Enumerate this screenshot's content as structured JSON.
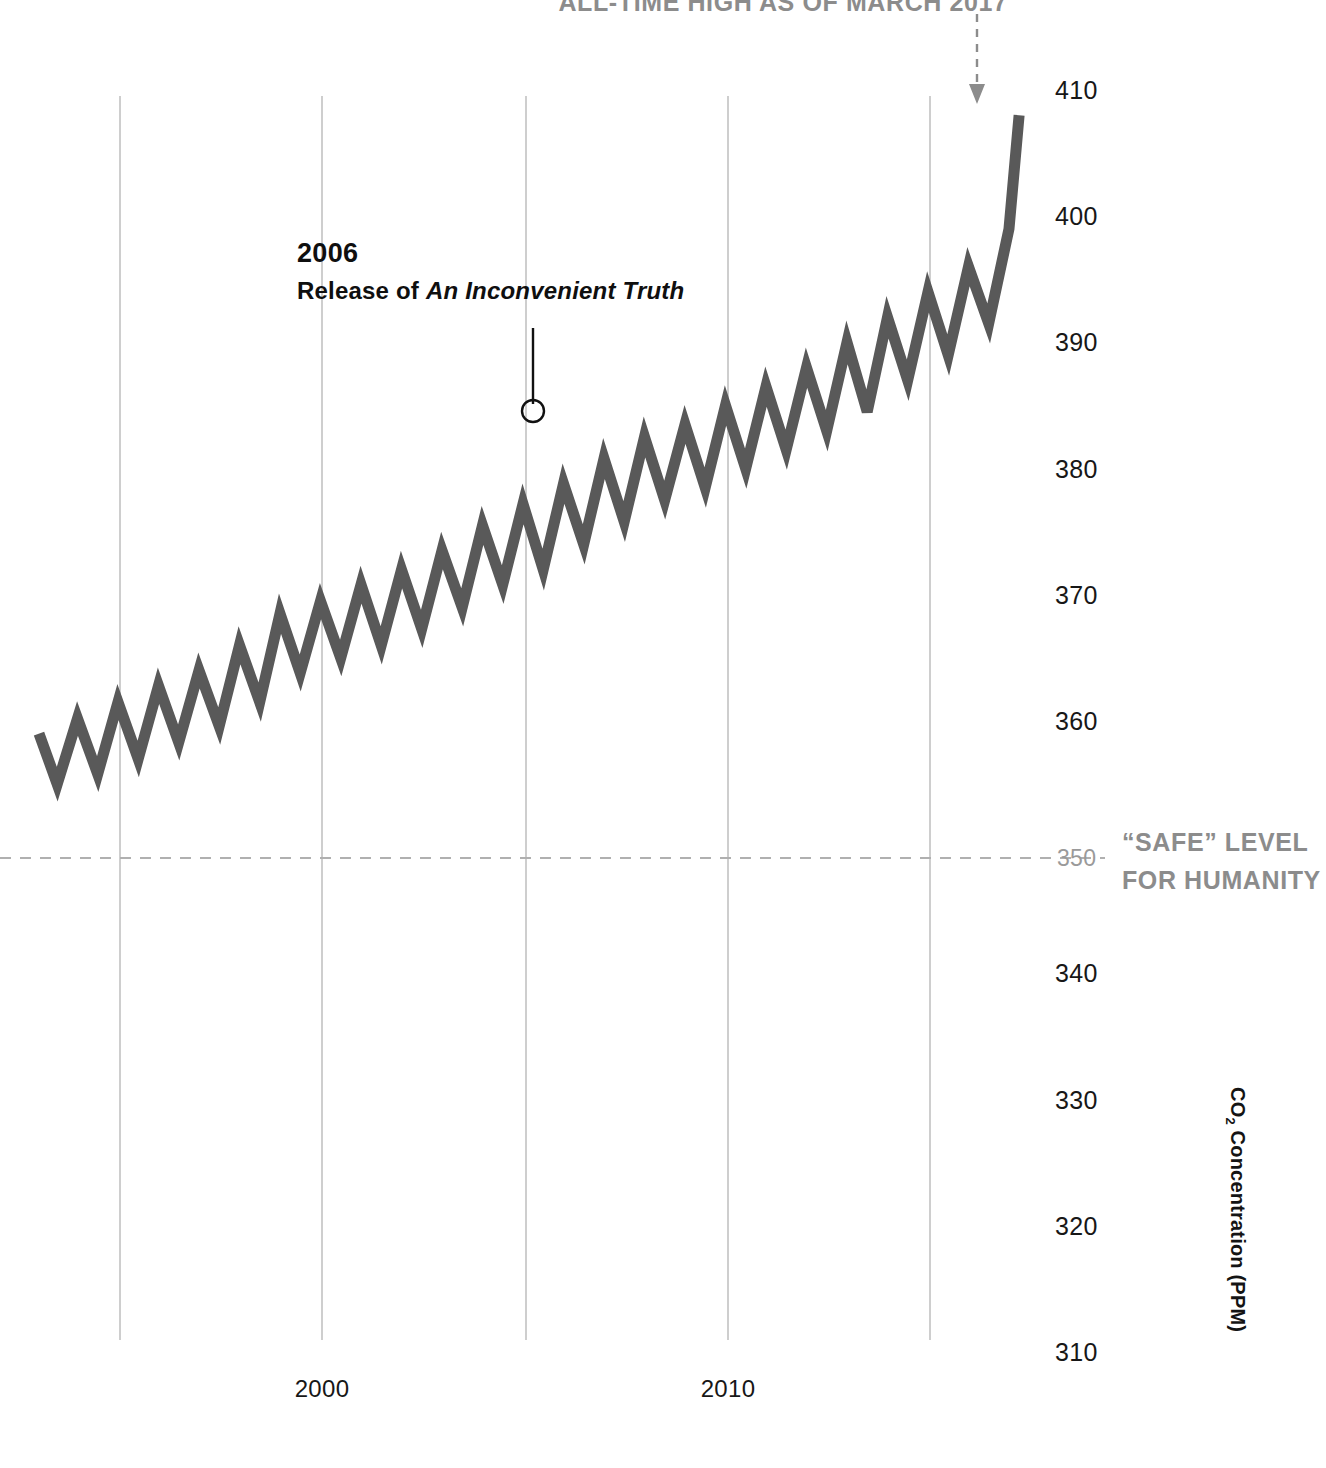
{
  "top_callout": "ALL-TIME HIGH AS OF MARCH 2017",
  "axis_title": "CO",
  "axis_title_sub": "2",
  "axis_title_rest": " Concentration (PPM)",
  "safe_label_line1": "“SAFE” LEVEL",
  "safe_label_line2": "FOR HUMANITY",
  "annotation": {
    "year": "2006",
    "desc_prefix": "Release of ",
    "desc_title": "An Inconvenient Truth"
  },
  "colors": {
    "curve": "#595959",
    "grid": "#b9b9b9",
    "safe_dash": "#b0b0b0",
    "text": "#171717",
    "muted": "#8c8c8c"
  },
  "chart_data": {
    "type": "line",
    "title": "",
    "xlabel": "",
    "ylabel": "CO2 Concentration (PPM)",
    "xlim": [
      1993.0,
      2017.25
    ],
    "ylim": [
      310,
      410
    ],
    "grid": true,
    "legend": false,
    "yticks": [
      410,
      400,
      390,
      380,
      370,
      360,
      350,
      340,
      330,
      320,
      310
    ],
    "ytick_labels": [
      "410",
      "400",
      "390",
      "380",
      "370",
      "360",
      "350",
      "340",
      "330",
      "320",
      "310"
    ],
    "xticks": [
      1995,
      2000,
      2005,
      2010,
      2015
    ],
    "xtick_labels": [
      "",
      "2000",
      "",
      "2010",
      ""
    ],
    "reference_line": {
      "value": 350,
      "style": "dashed",
      "label": "“SAFE” LEVEL FOR HUMANITY"
    },
    "annotations": [
      {
        "x": 2005.6,
        "y": 384.5,
        "text": "2006 Release of An Inconvenient Truth",
        "marker": "circle"
      },
      {
        "x": 2017.2,
        "y": 408.0,
        "text": "ALL-TIME HIGH AS OF MARCH 2017",
        "marker": "arrow"
      }
    ],
    "series": [
      {
        "name": "Monthly mean CO2 (Mauna Loa)",
        "x": [
          1993.0,
          1993.45,
          1993.95,
          1994.45,
          1994.95,
          1995.45,
          1995.95,
          1996.45,
          1996.95,
          1997.45,
          1997.95,
          1998.45,
          1998.95,
          1999.45,
          1999.95,
          2000.45,
          2000.95,
          2001.45,
          2001.95,
          2002.45,
          2002.95,
          2003.45,
          2003.95,
          2004.45,
          2004.95,
          2005.45,
          2005.95,
          2006.45,
          2006.95,
          2007.45,
          2007.95,
          2008.45,
          2008.95,
          2009.45,
          2009.95,
          2010.45,
          2010.95,
          2011.45,
          2011.95,
          2012.45,
          2012.95,
          2013.45,
          2013.95,
          2014.45,
          2014.95,
          2015.45,
          2015.95,
          2016.45,
          2016.95,
          2017.2
        ],
        "y": [
          359.0,
          355.0,
          360.2,
          355.8,
          361.5,
          357.0,
          362.8,
          358.3,
          364.0,
          359.6,
          366.0,
          361.5,
          368.5,
          363.8,
          369.5,
          365.0,
          370.8,
          366.0,
          372.0,
          367.3,
          373.5,
          369.0,
          375.5,
          370.8,
          377.2,
          372.0,
          378.8,
          374.0,
          380.8,
          375.8,
          382.5,
          377.5,
          383.5,
          378.5,
          385.0,
          380.0,
          386.5,
          381.5,
          388.0,
          383.0,
          390.0,
          384.5,
          392.0,
          387.0,
          394.0,
          389.0,
          396.0,
          391.5,
          399.0,
          408.0
        ],
        "note": "seasonal sawtooth: spring maxima / autumn minima, rising trend"
      }
    ]
  }
}
